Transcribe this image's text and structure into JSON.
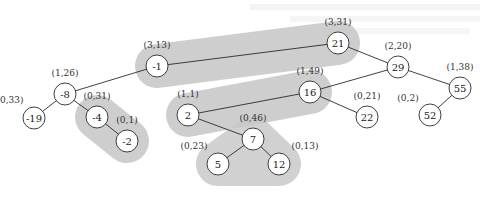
{
  "diagram": {
    "type": "binary-tree",
    "nodes": [
      {
        "id": "n21",
        "key": "21",
        "annotation": "(3,31)"
      },
      {
        "id": "n-1",
        "key": "-1",
        "annotation": "(3,13)"
      },
      {
        "id": "n29",
        "key": "29",
        "annotation": "(2,20)"
      },
      {
        "id": "n-8",
        "key": "-8",
        "annotation": "(1,26)"
      },
      {
        "id": "n16",
        "key": "16",
        "annotation": "(1,49)"
      },
      {
        "id": "n55",
        "key": "55",
        "annotation": "(1,38)"
      },
      {
        "id": "n-19",
        "key": "-19",
        "annotation": "(0,33)"
      },
      {
        "id": "n-4",
        "key": "-4",
        "annotation": "(0,31)"
      },
      {
        "id": "n2",
        "key": "2",
        "annotation": "(1,1)"
      },
      {
        "id": "n22",
        "key": "22",
        "annotation": "(0,21)"
      },
      {
        "id": "n52",
        "key": "52",
        "annotation": "(0,2)"
      },
      {
        "id": "n-2",
        "key": "-2",
        "annotation": "(0,1)"
      },
      {
        "id": "n7",
        "key": "7",
        "annotation": "(0,46)"
      },
      {
        "id": "n5",
        "key": "5",
        "annotation": "(0,23)"
      },
      {
        "id": "n12",
        "key": "12",
        "annotation": "(0,13)"
      }
    ],
    "edges": [
      [
        "n21",
        "n-1"
      ],
      [
        "n21",
        "n29"
      ],
      [
        "n-1",
        "n-8"
      ],
      [
        "n-8",
        "n-19"
      ],
      [
        "n-8",
        "n-4"
      ],
      [
        "n-4",
        "n-2"
      ],
      [
        "n29",
        "n16"
      ],
      [
        "n29",
        "n55"
      ],
      [
        "n16",
        "n2"
      ],
      [
        "n16",
        "n22"
      ],
      [
        "n2",
        "n7"
      ],
      [
        "n7",
        "n5"
      ],
      [
        "n7",
        "n12"
      ],
      [
        "n55",
        "n52"
      ]
    ],
    "highlighted_paths": [
      [
        "n-1",
        "n21"
      ],
      [
        "n-4",
        "n-2"
      ],
      [
        "n2",
        "n16"
      ],
      [
        "n7",
        "n5",
        "n12"
      ]
    ]
  }
}
